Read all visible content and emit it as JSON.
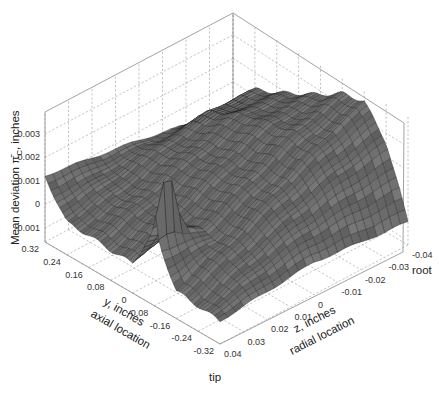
{
  "chart_data": {
    "type": "surface3d",
    "title": "",
    "zlabel": "Mean deviation π̄C, inches",
    "zlabel_main": "Mean deviation ",
    "zlabel_sym": "π̄",
    "zlabel_sub": "C",
    "zlabel_tail": ", inches",
    "xlabel_line1": "y, inches",
    "xlabel_line2": "axial location",
    "ylabel_line1": "z, inches",
    "ylabel_line2": "radial location",
    "annotations": {
      "tip": "tip",
      "root": "root"
    },
    "y_axis_ticks": [
      "0.32",
      "0.24",
      "0.16",
      "0.08",
      "0",
      "-0.08",
      "-0.16",
      "-0.24",
      "-0.32"
    ],
    "z_axis_ticks": [
      "0.04",
      "0.03",
      "0.02",
      "0.01",
      "0",
      "-0.01",
      "-0.02",
      "-0.03",
      "-0.04"
    ],
    "vertical_ticks": [
      "0.003",
      "0.002",
      "0.001",
      "0",
      "-0.001"
    ],
    "vertical_tick_values": [
      0.003,
      0.002,
      0.001,
      0,
      -0.001
    ],
    "ranges": {
      "y_axial": [
        -0.32,
        0.32
      ],
      "z_radial": [
        -0.04,
        0.04
      ],
      "deviation": [
        -0.0016,
        0.0039
      ]
    },
    "grid": true,
    "surface_description": "Mostly flat surface near 0 with a raised ridge (~0.003) along the back (root-side / positive-y edge), a sharp spike near the tip-side front edge at y~-0.08, and drooping edges toward -0.001 at the tip and root ends.",
    "surface_samples": {
      "y": [
        0.32,
        0.24,
        0.16,
        0.08,
        0,
        -0.08,
        -0.16,
        -0.24,
        -0.32
      ],
      "z": [
        0.04,
        0.02,
        0,
        -0.02,
        -0.04
      ],
      "values": [
        [
          0.0012,
          0.0009,
          0.0006,
          0.0002,
          -0.0004
        ],
        [
          -0.0002,
          0.0003,
          0.0009,
          0.0013,
          0.0012
        ],
        [
          -0.0002,
          0.0004,
          0.0012,
          0.0018,
          0.0016
        ],
        [
          -0.0003,
          0.0005,
          0.0014,
          0.0022,
          0.0021
        ],
        [
          -0.0003,
          0.0005,
          0.0015,
          0.0024,
          0.0026
        ],
        [
          0.0016,
          0.0006,
          0.0016,
          0.0026,
          0.0032
        ],
        [
          -0.0004,
          0.0005,
          0.0016,
          0.0026,
          0.0034
        ],
        [
          -0.0005,
          0.0004,
          0.0012,
          0.0018,
          0.0022
        ],
        [
          -0.0006,
          -0.0004,
          -0.0002,
          -0.0004,
          -0.0006
        ]
      ]
    }
  }
}
